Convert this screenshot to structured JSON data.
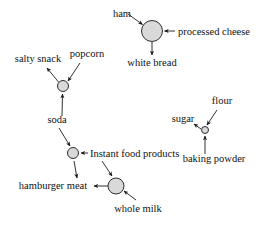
{
  "diagram": {
    "type": "directed-graph",
    "background_color": "#ffffff",
    "node_fill_color": "#d9d9d9",
    "stroke_color": "#1a1a1a",
    "hub_nodes": [
      {
        "id": "hub-white-bread",
        "label": "",
        "cx": 152,
        "cy": 31,
        "r": 10.5
      },
      {
        "id": "hub-salty-snack",
        "label": "",
        "cx": 63,
        "cy": 86,
        "r": 5.5
      },
      {
        "id": "hub-instant-food",
        "label": "",
        "cx": 73,
        "cy": 153,
        "r": 5.5
      },
      {
        "id": "hub-hamburger-meat",
        "label": "",
        "cx": 116,
        "cy": 186,
        "r": 8.0
      },
      {
        "id": "hub-sugar",
        "label": "",
        "cx": 205,
        "cy": 130,
        "r": 3.5
      }
    ],
    "labels": [
      {
        "id": "label-ham",
        "text": "ham",
        "x": 122,
        "y": 17,
        "anchor": "middle"
      },
      {
        "id": "label-processed-cheese",
        "text": "processed cheese",
        "x": 178,
        "y": 35,
        "anchor": "start"
      },
      {
        "id": "label-white-bread",
        "text": "white bread",
        "x": 152,
        "y": 66,
        "anchor": "middle"
      },
      {
        "id": "label-salty-snack",
        "text": "salty snack",
        "x": 38,
        "y": 62,
        "anchor": "middle"
      },
      {
        "id": "label-popcorn",
        "text": "popcorn",
        "x": 87,
        "y": 57,
        "anchor": "middle"
      },
      {
        "id": "label-soda",
        "text": "soda",
        "x": 57,
        "y": 123,
        "anchor": "middle"
      },
      {
        "id": "label-instant-food-products",
        "text": "Instant food products",
        "x": 90,
        "y": 157,
        "anchor": "start"
      },
      {
        "id": "label-hamburger-meat",
        "text": "hamburger meat",
        "x": 53,
        "y": 189,
        "anchor": "middle"
      },
      {
        "id": "label-whole-milk",
        "text": "whole milk",
        "x": 138,
        "y": 212,
        "anchor": "middle"
      },
      {
        "id": "label-flour",
        "text": "flour",
        "x": 222,
        "y": 104,
        "anchor": "middle"
      },
      {
        "id": "label-sugar",
        "text": "sugar",
        "x": 183,
        "y": 122,
        "anchor": "middle"
      },
      {
        "id": "label-baking-powder",
        "text": "baking powder",
        "x": 214,
        "y": 162,
        "anchor": "middle"
      }
    ],
    "edges": [
      {
        "id": "edge-ham-to-hub",
        "from": "ham",
        "to": "hub-white-bread",
        "direction": "to-node"
      },
      {
        "id": "edge-processed-cheese-to-hub",
        "from": "processed cheese",
        "to": "hub-white-bread",
        "direction": "to-node"
      },
      {
        "id": "edge-hub-to-white-bread",
        "from": "hub-white-bread",
        "to": "white bread",
        "direction": "from-node"
      },
      {
        "id": "edge-hub-to-salty-snack",
        "from": "hub-salty-snack",
        "to": "salty snack",
        "direction": "from-node"
      },
      {
        "id": "edge-popcorn-to-hub",
        "from": "popcorn",
        "to": "hub-salty-snack",
        "direction": "to-node"
      },
      {
        "id": "edge-soda-to-hub",
        "from": "soda",
        "to": "hub-salty-snack",
        "direction": "to-node"
      },
      {
        "id": "edge-soda-to-instant-hub",
        "from": "soda",
        "to": "hub-instant-food",
        "direction": "to-node"
      },
      {
        "id": "edge-instant-food-to-hub",
        "from": "Instant food products",
        "to": "hub-instant-food",
        "direction": "to-node"
      },
      {
        "id": "edge-instant-hub-to-hamburger",
        "from": "hub-instant-food",
        "to": "hamburger meat",
        "direction": "from-node"
      },
      {
        "id": "edge-instant-food-to-milk-hub",
        "from": "Instant food products",
        "to": "hub-hamburger-meat",
        "direction": "to-node"
      },
      {
        "id": "edge-whole-milk-to-hub",
        "from": "whole milk",
        "to": "hub-hamburger-meat",
        "direction": "to-node"
      },
      {
        "id": "edge-milk-hub-to-hamburger",
        "from": "hub-hamburger-meat",
        "to": "hamburger meat",
        "direction": "from-node"
      },
      {
        "id": "edge-flour-to-hub",
        "from": "flour",
        "to": "hub-sugar",
        "direction": "to-node"
      },
      {
        "id": "edge-baking-powder-to-hub",
        "from": "baking powder",
        "to": "hub-sugar",
        "direction": "to-node"
      },
      {
        "id": "edge-hub-to-sugar",
        "from": "hub-sugar",
        "to": "sugar",
        "direction": "from-node"
      }
    ]
  }
}
